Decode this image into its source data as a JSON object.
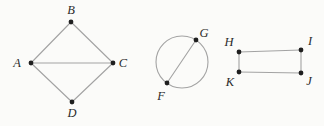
{
  "figure": {
    "canvas": {
      "width": 324,
      "height": 126
    },
    "colors": {
      "background": "#fbfbf9",
      "edge": "#a3a3a3",
      "dot": "#1f1f1f",
      "label": "#2b2b2b"
    },
    "dot_radius": 2.4,
    "edge_width": 1.1,
    "diagrams": [
      {
        "name": "quadrilateral-ABCD",
        "type": "graph",
        "vertices": [
          {
            "label": "A",
            "x": 31,
            "y": 63,
            "label_x": 17,
            "label_y": 63
          },
          {
            "label": "B",
            "x": 71,
            "y": 22,
            "label_x": 71,
            "label_y": 10
          },
          {
            "label": "C",
            "x": 113,
            "y": 63,
            "label_x": 123,
            "label_y": 63
          },
          {
            "label": "D",
            "x": 72,
            "y": 102,
            "label_x": 72,
            "label_y": 113
          }
        ],
        "edges": [
          [
            "A",
            "B"
          ],
          [
            "B",
            "C"
          ],
          [
            "A",
            "C"
          ],
          [
            "A",
            "D"
          ],
          [
            "D",
            "C"
          ]
        ]
      },
      {
        "name": "circle-with-chord-FG",
        "type": "circle-chord",
        "circle": {
          "cx": 182,
          "cy": 62,
          "r": 26
        },
        "vertices": [
          {
            "label": "G",
            "x": 196,
            "y": 40,
            "label_x": 204,
            "label_y": 33
          },
          {
            "label": "F",
            "x": 167,
            "y": 83,
            "label_x": 161,
            "label_y": 96
          }
        ],
        "edges": [
          [
            "F",
            "G"
          ]
        ]
      },
      {
        "name": "rectangle-HIJK",
        "type": "graph",
        "vertices": [
          {
            "label": "H",
            "x": 239,
            "y": 52,
            "label_x": 229,
            "label_y": 42
          },
          {
            "label": "I",
            "x": 301,
            "y": 50,
            "label_x": 310,
            "label_y": 41
          },
          {
            "label": "K",
            "x": 239,
            "y": 72,
            "label_x": 230,
            "label_y": 82
          },
          {
            "label": "J",
            "x": 301,
            "y": 73,
            "label_x": 309,
            "label_y": 81
          }
        ],
        "edges": [
          [
            "H",
            "I"
          ],
          [
            "I",
            "J"
          ],
          [
            "K",
            "J"
          ],
          [
            "H",
            "K"
          ]
        ]
      }
    ]
  }
}
